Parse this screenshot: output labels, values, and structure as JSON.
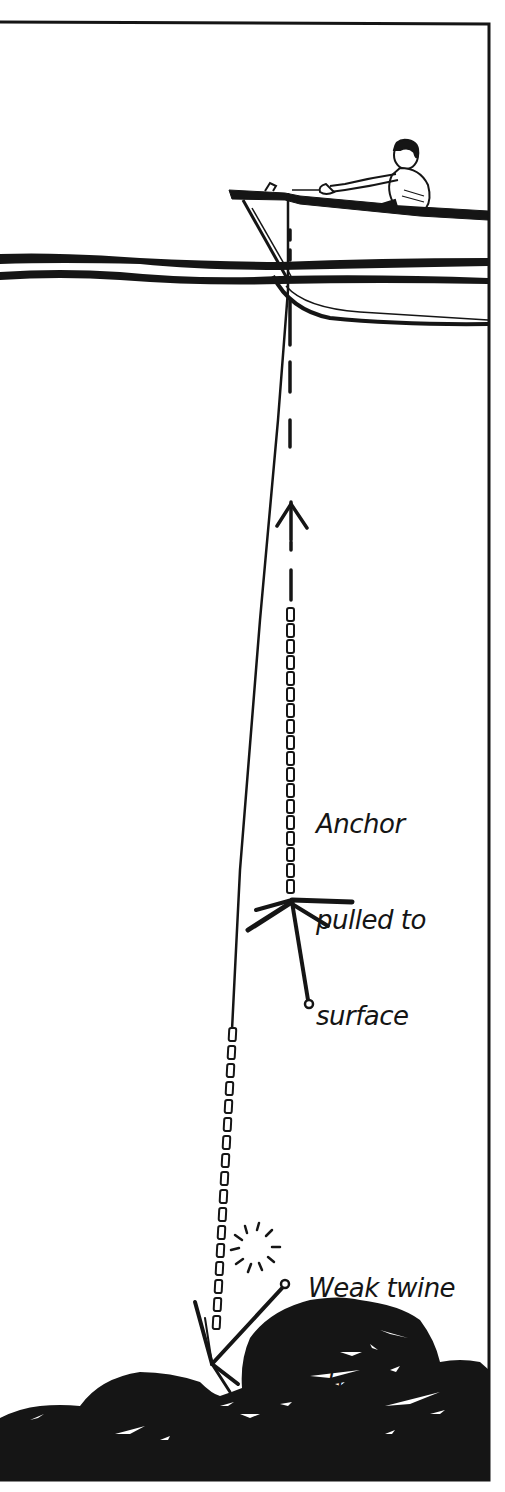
{
  "figure": {
    "type": "illustration",
    "colors": {
      "ink": "#151515",
      "background": "#ffffff"
    },
    "labels": {
      "anchor_surfaced": {
        "lines": [
          "Anchor",
          "pulled to",
          "surface"
        ]
      },
      "twine_breaks": {
        "lines": [
          "Weak twine",
          "breaks"
        ]
      }
    },
    "elements": [
      "frame-border",
      "rowboat-with-person",
      "water-surface",
      "anchor-line",
      "dashed-pull-path",
      "up-arrow",
      "anchor-at-surface",
      "chain",
      "snap-burst",
      "anchor-snagged",
      "rocky-seabed"
    ]
  }
}
